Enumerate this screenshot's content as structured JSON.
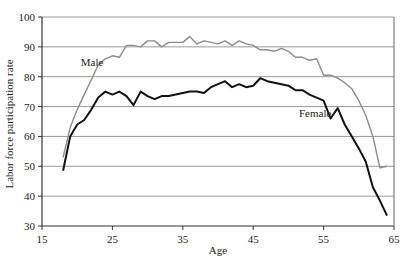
{
  "chart_data": {
    "type": "line",
    "title": "",
    "xlabel": "Age",
    "ylabel": "Labor force participation rate",
    "xlim": [
      15,
      65
    ],
    "ylim": [
      30,
      100
    ],
    "x_ticks": [
      15,
      25,
      35,
      45,
      55,
      65
    ],
    "y_ticks": [
      30,
      40,
      50,
      60,
      70,
      80,
      90,
      100
    ],
    "grid": "horizontal",
    "legend": "inline labels",
    "x": [
      18,
      19,
      20,
      21,
      22,
      23,
      24,
      25,
      26,
      27,
      28,
      29,
      30,
      31,
      32,
      33,
      34,
      35,
      36,
      37,
      38,
      39,
      40,
      41,
      42,
      43,
      44,
      45,
      46,
      47,
      48,
      49,
      50,
      51,
      52,
      53,
      54,
      55,
      56,
      57,
      58,
      59,
      60,
      61,
      62,
      63,
      64
    ],
    "series": [
      {
        "name": "Male",
        "color": "#8c8c8c",
        "label_pos": {
          "x": 20.5,
          "y": 83.5
        },
        "values": [
          53,
          63,
          69,
          74,
          79,
          84,
          86,
          87,
          86.5,
          90.5,
          90.5,
          90,
          92,
          92,
          90,
          91.5,
          91.5,
          91.5,
          93.5,
          91,
          92,
          91.5,
          91,
          92,
          90.5,
          92,
          91,
          90.5,
          89,
          89,
          88.5,
          89.5,
          88.5,
          86.5,
          86.5,
          85.5,
          86,
          80.5,
          80.5,
          79.5,
          78,
          76,
          72,
          67,
          60,
          49.5,
          50
        ]
      },
      {
        "name": "Female",
        "color": "#111111",
        "label_pos": {
          "x": 51.5,
          "y": 66.5
        },
        "values": [
          48.5,
          60,
          64,
          65.5,
          69,
          73,
          75,
          74,
          75,
          73.5,
          70.5,
          75,
          73.5,
          72.5,
          73.5,
          73.5,
          74,
          74.5,
          75,
          75,
          74.5,
          76.5,
          77.5,
          78.5,
          76.5,
          77.5,
          76.5,
          77,
          79.5,
          78.5,
          78,
          77.5,
          77,
          75.5,
          75.5,
          74,
          73,
          72,
          66,
          69.5,
          64,
          60,
          56,
          51.5,
          43,
          38.5,
          33.5
        ]
      }
    ]
  }
}
